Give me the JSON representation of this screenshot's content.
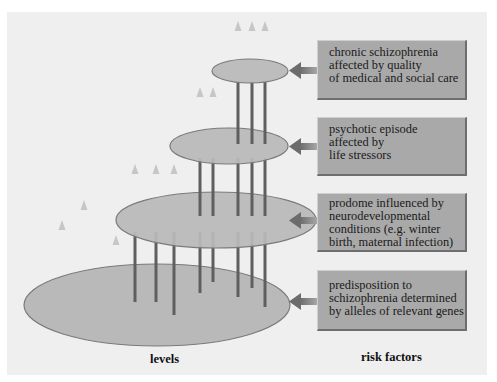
{
  "diagram": {
    "colors": {
      "background": "#efefef",
      "ellipse_fill": "#b9b9b9",
      "ellipse_stroke": "#7a7a7a",
      "rod": "#5f5f5f",
      "box_fill": "#a9a9a9",
      "arrow": "#808080"
    },
    "levels_label": "levels",
    "risk_factors_label": "risk factors",
    "risk_factors": [
      {
        "level": 4,
        "lines": [
          "chronic schizophrenia",
          "affected by quality",
          "of medical and social care"
        ]
      },
      {
        "level": 3,
        "lines": [
          "psychotic episode",
          "affected by",
          "life stressors"
        ]
      },
      {
        "level": 2,
        "lines": [
          "prodome influenced by",
          "neurodevelopmental",
          "conditions (e.g. winter",
          "birth, maternal infection)"
        ]
      },
      {
        "level": 1,
        "lines": [
          "predisposition to",
          "schizophrenia determined",
          "by alleles of relevant genes"
        ]
      }
    ]
  }
}
